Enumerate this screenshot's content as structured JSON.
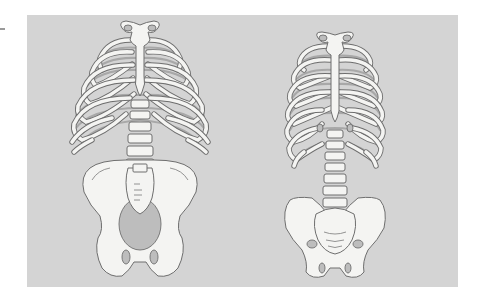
{
  "figure": {
    "panel_color": "#d4d4d4",
    "bone_color": "#f4f4f2",
    "outline_color": "#6e6e6e",
    "illustrations": [
      {
        "id": "left",
        "subject": "rib-cage-spine-wide-pelvis"
      },
      {
        "id": "right",
        "subject": "rib-cage-spine-narrow-pelvis"
      }
    ]
  }
}
